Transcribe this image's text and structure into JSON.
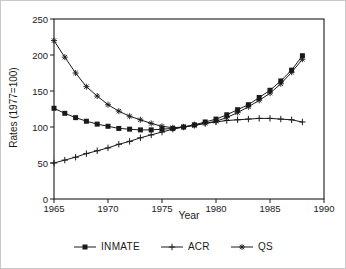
{
  "chart_data": {
    "type": "line",
    "title": "",
    "xlabel": "Year",
    "ylabel": "Rates (1977=100)",
    "xlim": [
      1965,
      1990
    ],
    "ylim": [
      0,
      250
    ],
    "x_ticks": [
      1965,
      1970,
      1975,
      1980,
      1985,
      1990
    ],
    "y_ticks": [
      0,
      50,
      100,
      150,
      200,
      250
    ],
    "grid": false,
    "legend_position": "bottom",
    "line_color": "#1a1a1a",
    "x": [
      1965,
      1966,
      1967,
      1968,
      1969,
      1970,
      1971,
      1972,
      1973,
      1974,
      1975,
      1976,
      1977,
      1978,
      1979,
      1980,
      1981,
      1982,
      1983,
      1984,
      1985,
      1986,
      1987,
      1988
    ],
    "series": [
      {
        "name": "INMATE",
        "marker": "square",
        "values": [
          126,
          119,
          113,
          108,
          104,
          101,
          98,
          97,
          96,
          96,
          97,
          98,
          100,
          103,
          107,
          111,
          117,
          124,
          131,
          141,
          151,
          164,
          179,
          199
        ]
      },
      {
        "name": "ACR",
        "marker": "plus",
        "values": [
          50,
          54,
          58,
          63,
          67,
          71,
          76,
          80,
          85,
          89,
          93,
          97,
          100,
          103,
          105,
          107,
          109,
          110,
          111,
          112,
          112,
          111,
          110,
          107
        ]
      },
      {
        "name": "QS",
        "marker": "asterisk",
        "values": [
          220,
          197,
          175,
          156,
          143,
          131,
          122,
          115,
          110,
          105,
          101,
          99,
          100,
          102,
          105,
          108,
          113,
          120,
          128,
          137,
          147,
          160,
          176,
          194
        ]
      }
    ]
  }
}
